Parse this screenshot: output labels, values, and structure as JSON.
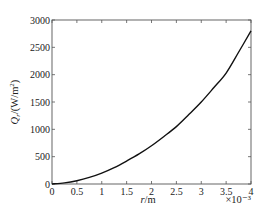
{
  "chart_data": {
    "type": "line",
    "title": "",
    "xlabel": "r/m",
    "xlabel_italic_part": "r",
    "xlabel_unit": "/m",
    "x_multiplier": "×10⁻³",
    "ylabel": "Q_r/(W/m²)",
    "ylabel_symbol": "Q",
    "ylabel_sub": "r",
    "ylabel_unit": "/(W/m",
    "ylabel_sup": "2",
    "ylabel_close": ")",
    "xlim": [
      0,
      4
    ],
    "ylim": [
      0,
      3000
    ],
    "xticks": [
      0,
      0.5,
      1,
      1.5,
      2,
      2.5,
      3,
      3.5,
      4
    ],
    "xtick_labels": [
      "0",
      "0.5",
      "1",
      "1.5",
      "2",
      "2.5",
      "3",
      "3.5",
      "4"
    ],
    "yticks": [
      0,
      500,
      1000,
      1500,
      2000,
      2500,
      3000
    ],
    "ytick_labels": [
      "0",
      "500",
      "1000",
      "1500",
      "2000",
      "2500",
      "3000"
    ],
    "grid": false,
    "legend": null,
    "series": [
      {
        "name": "Q_r",
        "color": "#111111",
        "x": [
          0,
          0.25,
          0.5,
          0.75,
          1,
          1.25,
          1.5,
          1.75,
          2,
          2.25,
          2.5,
          2.75,
          3,
          3.25,
          3.5,
          3.75,
          4
        ],
        "y": [
          0,
          20,
          60,
          120,
          200,
          300,
          420,
          550,
          700,
          870,
          1050,
          1270,
          1500,
          1760,
          2030,
          2410,
          2800
        ]
      }
    ]
  }
}
